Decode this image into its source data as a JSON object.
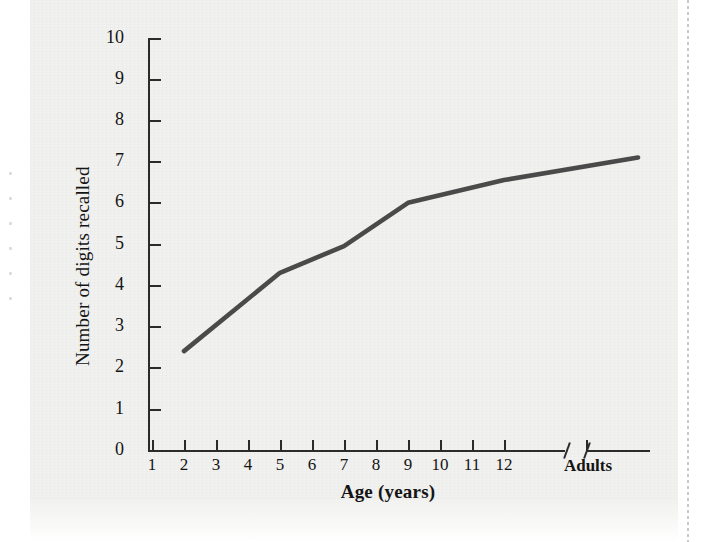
{
  "figure": {
    "background_color": "#f1f1ef",
    "ink_color": "#2b2b2b",
    "line_color": "#3d3d3d"
  },
  "chart_data": {
    "type": "line",
    "title": "",
    "xlabel": "Age (years)",
    "ylabel": "Number of digits recalled",
    "xtick_labels": [
      "1",
      "2",
      "3",
      "4",
      "5",
      "6",
      "7",
      "8",
      "9",
      "10",
      "11",
      "12",
      "Adults"
    ],
    "ytick_labels": [
      "0",
      "1",
      "2",
      "3",
      "4",
      "5",
      "6",
      "7",
      "8",
      "9",
      "10"
    ],
    "ylim": [
      0,
      10
    ],
    "xlim_note": "ages 1-12 linear, then axis break, then Adults",
    "axis_break": true,
    "axis_break_symbol": "//",
    "grid": false,
    "legend": null,
    "x": [
      "2",
      "5",
      "7",
      "9",
      "12",
      "Adults"
    ],
    "values": [
      2.4,
      4.3,
      4.95,
      6.0,
      6.55,
      7.1
    ],
    "series": [
      {
        "name": "Digit span",
        "points": [
          {
            "age": "2",
            "digits": 2.4
          },
          {
            "age": "5",
            "digits": 4.3
          },
          {
            "age": "7",
            "digits": 4.95
          },
          {
            "age": "9",
            "digits": 6.0
          },
          {
            "age": "12",
            "digits": 6.55
          },
          {
            "age": "Adults",
            "digits": 7.1
          }
        ]
      }
    ]
  }
}
